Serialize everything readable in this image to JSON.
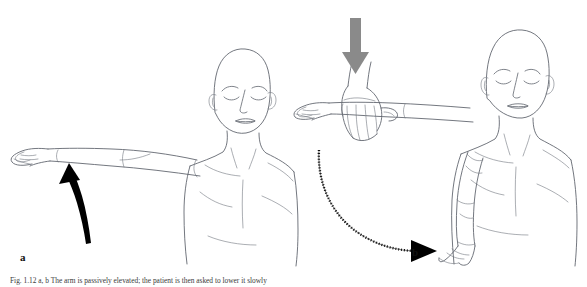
{
  "figure": {
    "panels": [
      {
        "id": "a",
        "label": "a",
        "name": "panel-a-elevation-start",
        "arrow": {
          "name": "black-curved-up-arrow",
          "color": "#000000",
          "direction": "upward",
          "style": "solid-curved"
        }
      },
      {
        "id": "b",
        "label": "b",
        "name": "panel-b-drop-test",
        "arrows": [
          {
            "name": "gray-down-arrow",
            "color": "#8a8a8a",
            "direction": "downward",
            "style": "solid-straight"
          },
          {
            "name": "black-hatched-arc-arrow",
            "color": "#111111",
            "direction": "downward-right-arc",
            "style": "hatched-curved"
          }
        ]
      }
    ],
    "caption": {
      "prefix": "Fig. 1.12",
      "bold_labels": "a, b",
      "text": "Fig. 1.12 a, b  The arm is passively elevated; the patient is then asked to lower it slowly"
    }
  }
}
